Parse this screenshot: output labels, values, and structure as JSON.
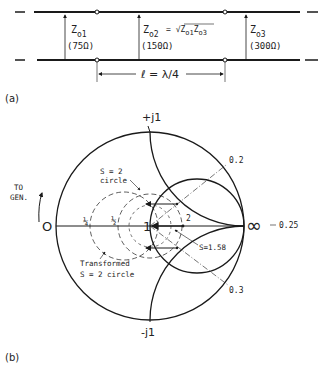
{
  "figure_a": {
    "caption": "(a)",
    "sections": [
      {
        "z_label": "Z",
        "z_sub": "o1",
        "value": "(75Ω)"
      },
      {
        "z_label": "Z",
        "z_sub": "o2",
        "formula": "= √Z",
        "formula_sub1": "o1",
        "formula_mid": "Z",
        "formula_sub2": "o3",
        "value": "(150Ω)"
      },
      {
        "z_label": "Z",
        "z_sub": "o3",
        "value": "(300Ω)"
      }
    ],
    "length_label": "ℓ = λ/4"
  },
  "figure_b": {
    "caption": "(b)",
    "top_label": "+j1",
    "bottom_label": "-j1",
    "left_label": "O",
    "right_label": "∞",
    "center_label": "1",
    "to_gen_line1": "TO",
    "to_gen_line2": "GEN.",
    "wavelength_labels": {
      "upper": "0.2",
      "right": "0.25",
      "lower": "0.3"
    },
    "point_labels": {
      "quarter": "¼",
      "half": "½",
      "two": "2"
    },
    "s2_label_line1": "S = 2",
    "s2_label_line2": "circle",
    "transformed_line1": "Transformed",
    "transformed_line2": "S = 2 circle",
    "s158_label": "S=1.58"
  }
}
